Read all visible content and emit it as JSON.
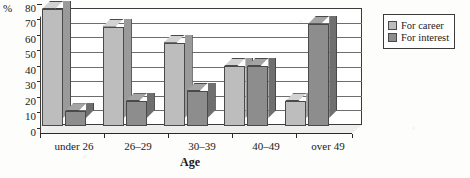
{
  "chart_data": {
    "type": "bar",
    "title": "",
    "xlabel": "Age",
    "ylabel": "%",
    "ylim": [
      0,
      80
    ],
    "yticks": [
      80,
      70,
      60,
      50,
      40,
      30,
      20,
      10,
      0
    ],
    "grid": true,
    "legend_position": "right",
    "categories": [
      "under 26",
      "26–29",
      "30–39",
      "40–49",
      "over 49"
    ],
    "series": [
      {
        "name": "For career",
        "color": "#bdbdbd",
        "values": [
          80,
          68,
          57,
          41,
          17
        ]
      },
      {
        "name": "For interest",
        "color": "#8d8d8d",
        "values": [
          10,
          17,
          24,
          41,
          70
        ]
      }
    ]
  },
  "axes": {
    "y_unit_label": "%",
    "x_axis_title": "Age",
    "tick_0": "0",
    "tick_10": "10",
    "tick_20": "20",
    "tick_30": "30",
    "tick_40": "40",
    "tick_50": "50",
    "tick_60": "60",
    "tick_70": "70",
    "tick_80": "80"
  },
  "legend": {
    "items": [
      {
        "label": "For career"
      },
      {
        "label": "For interest"
      }
    ]
  },
  "categories": {
    "c0": "under 26",
    "c1": "26–29",
    "c2": "30–39",
    "c3": "40–49",
    "c4": "over 49"
  }
}
